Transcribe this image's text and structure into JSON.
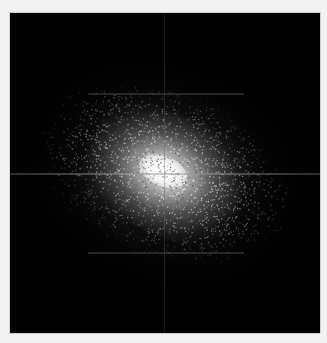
{
  "image": {
    "description": "2D Fourier transform magnitude spectrum: bright elliptical central blob on black background with faint horizontal and vertical axis lines",
    "background_color": "#020202",
    "border_color": "#f2f2f2",
    "center_color": "#ffffff"
  }
}
